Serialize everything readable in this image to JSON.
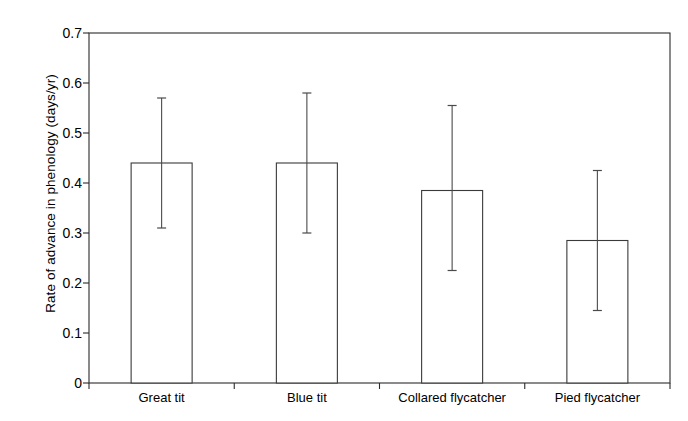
{
  "chart_data": {
    "type": "bar",
    "title": "",
    "xlabel": "",
    "ylabel": "Rate of advance in phenology (days/yr)",
    "categories": [
      "Great tit",
      "Blue tit",
      "Collared flycatcher",
      "Pied flycatcher"
    ],
    "values": [
      0.44,
      0.44,
      0.385,
      0.285
    ],
    "error_upper": [
      0.57,
      0.58,
      0.555,
      0.425
    ],
    "error_lower": [
      0.31,
      0.3,
      0.225,
      0.145
    ],
    "ylim": [
      0,
      0.7
    ],
    "yticks": [
      0,
      0.1,
      0.2,
      0.3,
      0.4,
      0.5,
      0.6,
      0.7
    ],
    "ytick_labels": [
      "0",
      "0.1",
      "0.2",
      "0.3",
      "0.4",
      "0.5",
      "0.6",
      "0.7"
    ],
    "grid": false,
    "legend": "none",
    "bar_fill": "#ffffff",
    "bar_stroke": "#3a3a3a",
    "axis_color": "#2b2b2b",
    "error_color": "#4a4a4a",
    "background": "#ffffff"
  },
  "axes": {
    "plot_left": 89,
    "plot_right": 670,
    "plot_top": 33,
    "plot_bottom": 383
  }
}
